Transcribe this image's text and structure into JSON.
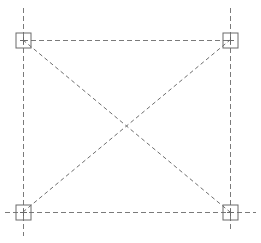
{
  "diagram": {
    "type": "structural-grid-plan",
    "colors": {
      "background": "#ffffff",
      "axis_line": "#7a7a7a",
      "diagonal_line": "#6e6e6e",
      "marker": "#6a6a6a"
    },
    "axes": {
      "vertical": [
        {
          "id": "left-axis",
          "x": 23,
          "y1": 8,
          "y2": 236
        },
        {
          "id": "right-axis",
          "x": 230,
          "y1": 8,
          "y2": 229
        }
      ],
      "horizontal": [
        {
          "id": "top-axis",
          "y": 40,
          "x1": 23,
          "x2": 230
        },
        {
          "id": "bottom-axis",
          "y": 212,
          "x1": 5,
          "x2": 256
        }
      ]
    },
    "diagonals": [
      {
        "id": "diagonal-tl-br",
        "x1": 23,
        "y1": 40,
        "x2": 230,
        "y2": 212
      },
      {
        "id": "diagonal-bl-tr",
        "x1": 23,
        "y1": 212,
        "x2": 230,
        "y2": 40
      }
    ],
    "markers": [
      {
        "id": "column-top-left",
        "cx": 23,
        "cy": 40,
        "size": 15
      },
      {
        "id": "column-top-right",
        "cx": 230,
        "cy": 40,
        "size": 15
      },
      {
        "id": "column-bottom-left",
        "cx": 23,
        "cy": 212,
        "size": 15
      },
      {
        "id": "column-bottom-right",
        "cx": 230,
        "cy": 212,
        "size": 15
      }
    ]
  }
}
